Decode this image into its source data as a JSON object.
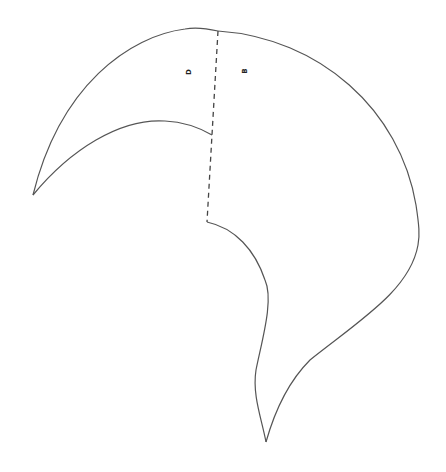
{
  "diagram": {
    "type": "sewing-pattern-piece",
    "labels": {
      "left_panel": "D",
      "right_panel": "B"
    },
    "colors": {
      "outline": "#555555",
      "seam_line": "#444444",
      "background": "#ffffff"
    },
    "seam_style": "dashed"
  }
}
